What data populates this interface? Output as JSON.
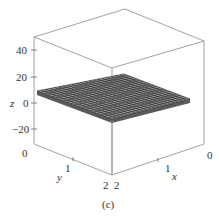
{
  "chart_data": {
    "type": "surface3d",
    "title": "",
    "caption": "(c)",
    "xlabel": "x",
    "ylabel": "y",
    "zlabel": "z",
    "x_ticks": [
      "0",
      "1",
      "2"
    ],
    "y_ticks": [
      "0",
      "1",
      "2"
    ],
    "z_ticks": [
      "40",
      "20",
      "0",
      "−20"
    ],
    "xlim": [
      0,
      2
    ],
    "ylim": [
      0,
      2
    ],
    "zlim": [
      -30,
      50
    ],
    "surface": {
      "description": "Nearly flat wireframe surface (thin slab) spanning x in [0,2], y in [0,2], at z approximately 5-10",
      "z_approx_min": 5,
      "z_approx_max": 10,
      "grid_resolution": 20
    },
    "box": true,
    "grid": false,
    "legend": null
  },
  "colors": {
    "axis": "#888888",
    "mesh_line": "#222222",
    "mesh_fill": "#9a9a9a",
    "text": "#333333"
  }
}
